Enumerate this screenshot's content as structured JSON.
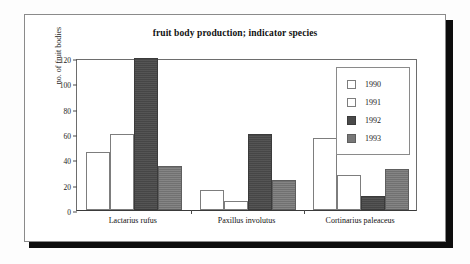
{
  "chart_data": {
    "type": "bar",
    "title": "fruit body production; indicator species",
    "xlabel": "",
    "ylabel": "no. of fruit bodies",
    "ylim": [
      0,
      120
    ],
    "yticks": [
      0,
      20,
      40,
      60,
      80,
      100,
      120
    ],
    "grid": false,
    "legend_position": "top-right",
    "categories": [
      "Lactarius rufus",
      "Paxillus involutus",
      "Cortinarius paleaceus"
    ],
    "series": [
      {
        "name": "1990",
        "color": "#ffffff",
        "values": [
          46,
          16,
          57
        ]
      },
      {
        "name": "1991",
        "color": "#ffffff",
        "values": [
          60,
          7,
          28
        ]
      },
      {
        "name": "1992",
        "color": "#4a4a4a",
        "values": [
          120,
          60,
          11
        ]
      },
      {
        "name": "1993",
        "color": "#777777",
        "values": [
          35,
          24,
          32
        ]
      }
    ]
  },
  "margin_text": "",
  "colors": {
    "frame_border": "#8a8a8a",
    "axis": "#4a4a4a",
    "text": "#1a1a1a",
    "shadow": "#0d0d0d"
  }
}
